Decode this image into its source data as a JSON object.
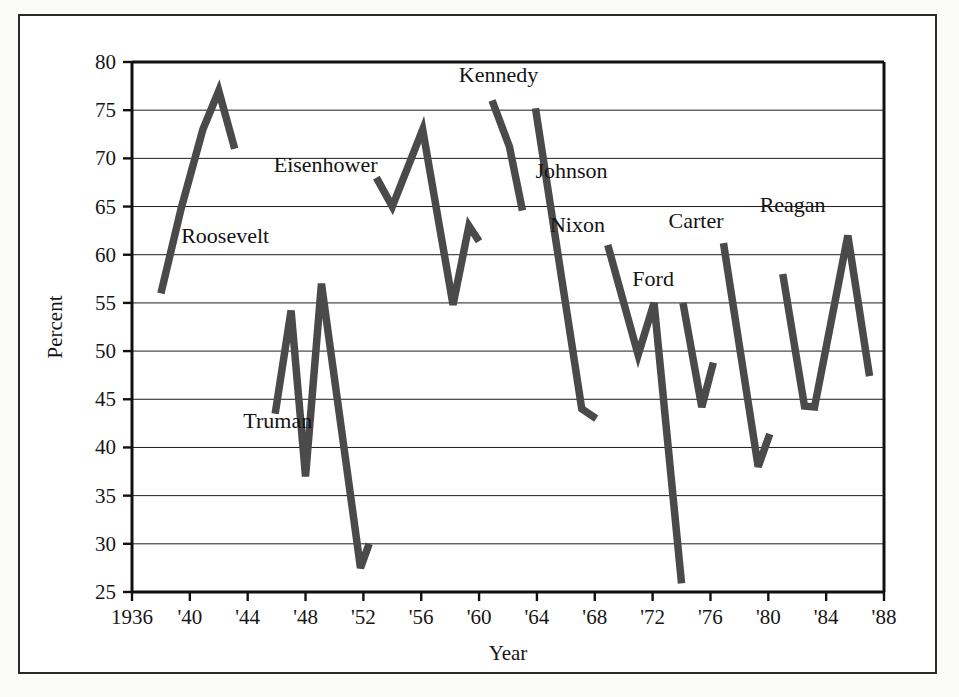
{
  "chart_data": {
    "type": "line",
    "title": "",
    "xlabel": "Year",
    "ylabel": "Percent",
    "xlim": [
      1936,
      1988
    ],
    "ylim": [
      25,
      80
    ],
    "grid": true,
    "legend_position": "inline-labels",
    "xticks": [
      "1936",
      "'40",
      "'44",
      "'48",
      "'52",
      "'56",
      "'60",
      "'64",
      "'68",
      "'72",
      "'76",
      "'80",
      "'84",
      "'88"
    ],
    "xtick_values": [
      1936,
      1940,
      1944,
      1948,
      1952,
      1956,
      1960,
      1964,
      1968,
      1972,
      1976,
      1980,
      1984,
      1988
    ],
    "yticks": [
      "25",
      "30",
      "35",
      "40",
      "45",
      "50",
      "55",
      "60",
      "65",
      "70",
      "75",
      "80"
    ],
    "ytick_values": [
      25,
      30,
      35,
      40,
      45,
      50,
      55,
      60,
      65,
      70,
      75,
      80
    ],
    "line_color": "#4a4a4a",
    "series": [
      {
        "name": "Roosevelt",
        "label": "Roosevelt",
        "label_x": 1939.4,
        "label_y": 61.2,
        "x": [
          1938.0,
          1939.4,
          1940.9,
          1942.0,
          1943.1
        ],
        "values": [
          56.0,
          64.8,
          73.0,
          77.0,
          71.0
        ]
      },
      {
        "name": "Truman",
        "label": "Truman",
        "label_x": 1943.7,
        "label_y": 42.0,
        "x": [
          1945.9,
          1947.0,
          1948.0,
          1949.1,
          1951.8,
          1952.4
        ],
        "values": [
          43.5,
          54.2,
          37.0,
          57.0,
          27.5,
          30.0
        ]
      },
      {
        "name": "Eisenhower",
        "label": "Eisenhower",
        "label_x": 1945.8,
        "label_y": 68.6,
        "x": [
          1952.9,
          1954.0,
          1956.1,
          1958.2,
          1959.3,
          1960.0
        ],
        "values": [
          68.0,
          65.0,
          73.0,
          54.8,
          63.0,
          61.4
        ]
      },
      {
        "name": "Kennedy",
        "label": "Kennedy",
        "label_x": 1958.6,
        "label_y": 77.9,
        "x": [
          1960.9,
          1962.1,
          1963.0
        ],
        "values": [
          76.0,
          71.2,
          64.6
        ]
      },
      {
        "name": "Johnson",
        "label": "Johnson",
        "label_x": 1963.9,
        "label_y": 68.0,
        "x": [
          1963.9,
          1967.1,
          1968.1
        ],
        "values": [
          75.2,
          44.0,
          43.0
        ]
      },
      {
        "name": "Nixon",
        "label": "Nixon",
        "label_x": 1964.9,
        "label_y": 62.4,
        "x": [
          1968.9,
          1971.0,
          1972.1,
          1974.0
        ],
        "values": [
          61.0,
          49.6,
          55.0,
          25.9
        ]
      },
      {
        "name": "Ford",
        "label": "Ford",
        "label_x": 1970.6,
        "label_y": 56.8,
        "x": [
          1974.1,
          1975.4,
          1976.2
        ],
        "values": [
          55.0,
          44.2,
          48.8
        ]
      },
      {
        "name": "Carter",
        "label": "Carter",
        "label_x": 1973.1,
        "label_y": 62.8,
        "x": [
          1976.9,
          1979.3,
          1980.1
        ],
        "values": [
          61.2,
          38.0,
          41.4
        ]
      },
      {
        "name": "Reagan",
        "label": "Reagan",
        "label_x": 1979.4,
        "label_y": 64.4,
        "x": [
          1981.0,
          1982.5,
          1983.2,
          1985.5,
          1987.0
        ],
        "values": [
          58.0,
          44.3,
          44.2,
          62.0,
          47.4
        ]
      }
    ]
  }
}
